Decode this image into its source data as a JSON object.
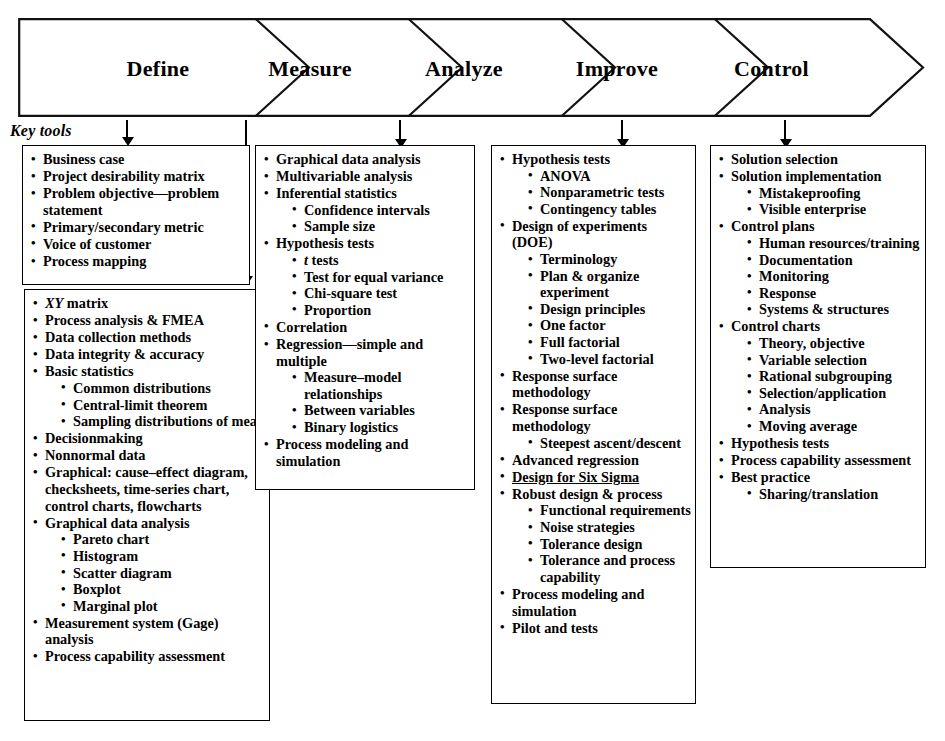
{
  "diagram": {
    "title_phases": [
      "Define",
      "Measure",
      "Analyze",
      "Improve",
      "Control"
    ],
    "key_tools_label": "Key tools",
    "columns": [
      {
        "phase": "Define",
        "boxes": [
          {
            "id": "define-box-1",
            "items": [
              {
                "text": "Business case"
              },
              {
                "text": "Project desirability matrix"
              },
              {
                "text": "Problem objective—problem statement"
              },
              {
                "text": "Primary/secondary metric"
              },
              {
                "text": "Voice of customer"
              },
              {
                "text": "Process mapping"
              }
            ]
          },
          {
            "id": "define-box-2",
            "items": [
              {
                "text": "XY matrix",
                "italic_prefix": "XY",
                "rest": " matrix"
              },
              {
                "text": "Process analysis & FMEA"
              },
              {
                "text": "Data collection methods"
              },
              {
                "text": "Data integrity & accuracy"
              },
              {
                "text": "Basic statistics",
                "sub": [
                  "Common distributions",
                  "Central-limit theorem",
                  "Sampling distributions of mean"
                ]
              },
              {
                "text": "Decisionmaking"
              },
              {
                "text": "Nonnormal data"
              },
              {
                "text": "Graphical: cause–effect diagram, checksheets, time-series chart, control charts, flowcharts"
              },
              {
                "text": "Graphical data analysis",
                "sub": [
                  "Pareto chart",
                  "Histogram",
                  "Scatter diagram",
                  "Boxplot",
                  "Marginal plot"
                ]
              },
              {
                "text": "Measurement system (Gage) analysis"
              },
              {
                "text": "Process capability assessment"
              }
            ]
          }
        ]
      },
      {
        "phase": "Measure",
        "boxes": [
          {
            "id": "measure-box-1",
            "items": [
              {
                "text": "Graphical data analysis"
              },
              {
                "text": "Multivariable analysis"
              },
              {
                "text": "Inferential statistics",
                "sub": [
                  "Confidence intervals",
                  "Sample size"
                ]
              },
              {
                "text": "Hypothesis tests",
                "sub": [
                  "t tests",
                  "Test for equal variance",
                  "Chi-square test",
                  "Proportion"
                ]
              },
              {
                "text": "Correlation"
              },
              {
                "text": "Regression—simple and multiple",
                "sub": [
                  "Measure–model relationships",
                  "Between variables",
                  "Binary logistics"
                ]
              },
              {
                "text": "Process modeling and simulation"
              }
            ]
          }
        ]
      },
      {
        "phase": "Analyze",
        "boxes": [
          {
            "id": "analyze-box-1",
            "items": [
              {
                "text": "Hypothesis tests",
                "sub": [
                  "ANOVA",
                  "Nonparametric tests",
                  "Contingency tables"
                ]
              },
              {
                "text": "Design of experiments (DOE)",
                "sub": [
                  "Terminology",
                  "Plan & organize experiment",
                  "Design principles",
                  "One factor",
                  "Full factorial",
                  "Two-level factorial"
                ]
              },
              {
                "text": "Response surface methodology"
              },
              {
                "text": "Response surface methodology",
                "sub": [
                  "Steepest ascent/descent"
                ]
              },
              {
                "text": "Advanced regression"
              },
              {
                "text": "Design for Six Sigma",
                "underline": true
              },
              {
                "text": "Robust design & process",
                "sub": [
                  "Functional requirements",
                  "Noise strategies",
                  "Tolerance design",
                  "Tolerance and process capability"
                ]
              },
              {
                "text": "Process modeling and simulation"
              },
              {
                "text": "Pilot and tests"
              }
            ]
          }
        ]
      },
      {
        "phase": "Control",
        "boxes": [
          {
            "id": "control-box-1",
            "items": [
              {
                "text": "Solution selection"
              },
              {
                "text": "Solution implementation",
                "sub": [
                  "Mistakeproofing",
                  "Visible enterprise"
                ]
              },
              {
                "text": "Control plans",
                "sub": [
                  "Human resources/training",
                  "Documentation",
                  "Monitoring",
                  "Response",
                  "Systems & structures"
                ]
              },
              {
                "text": "Control charts",
                "sub": [
                  "Theory, objective",
                  "Variable selection",
                  "Rational subgrouping",
                  "Selection/application",
                  "Analysis",
                  "Moving average"
                ]
              },
              {
                "text": "Hypothesis tests"
              },
              {
                "text": "Process capability assessment"
              },
              {
                "text": "Best practice",
                "sub": [
                  "Sharing/translation"
                ]
              }
            ]
          }
        ]
      }
    ]
  }
}
